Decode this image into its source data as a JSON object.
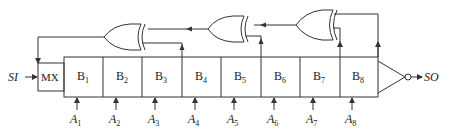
{
  "diagram": {
    "input_label": "SI",
    "output_label": "SO",
    "mux_label": "MX",
    "cells": [
      {
        "name": "B",
        "sub": "1",
        "x": 64
      },
      {
        "name": "B",
        "sub": "2",
        "x": 103
      },
      {
        "name": "B",
        "sub": "3",
        "x": 142
      },
      {
        "name": "B",
        "sub": "4",
        "x": 182
      },
      {
        "name": "B",
        "sub": "5",
        "x": 221
      },
      {
        "name": "B",
        "sub": "6",
        "x": 261
      },
      {
        "name": "B",
        "sub": "7",
        "x": 300
      },
      {
        "name": "B",
        "sub": "8",
        "x": 340
      }
    ],
    "inputs": [
      {
        "name": "A",
        "sub": "1"
      },
      {
        "name": "A",
        "sub": "2"
      },
      {
        "name": "A",
        "sub": "3"
      },
      {
        "name": "A",
        "sub": "4"
      },
      {
        "name": "A",
        "sub": "5"
      },
      {
        "name": "A",
        "sub": "6"
      },
      {
        "name": "A",
        "sub": "7"
      },
      {
        "name": "A",
        "sub": "8"
      }
    ],
    "gates": [
      {
        "type": "XOR",
        "id": "xor-1"
      },
      {
        "type": "XOR",
        "id": "xor-2"
      },
      {
        "type": "XOR",
        "id": "xor-3"
      },
      {
        "type": "NOT",
        "id": "output-inverter"
      }
    ],
    "colors": {
      "line": "#333333",
      "background": "#ffffff"
    }
  }
}
